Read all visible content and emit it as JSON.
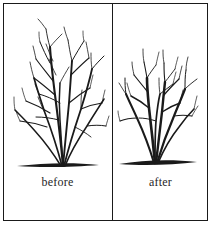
{
  "figure": {
    "background_color": "#ffffff",
    "ink_color": "#1a1a1a",
    "border_color": "#1a1a1a"
  },
  "panels": [
    {
      "id": "before",
      "caption": "before",
      "subject": "untrimmed-shrub",
      "description": "Tall dense deciduous shrub with many long unpruned branches",
      "branch_count": 14,
      "relative_height": "tall"
    },
    {
      "id": "after",
      "caption": "after",
      "subject": "pruned-shrub",
      "description": "Same shrub after pruning, shorter with fewer branches",
      "branch_count": 9,
      "relative_height": "short"
    }
  ],
  "labels": {
    "before": "before",
    "after": "after"
  },
  "icons": {
    "shrub_before": "shrub-untrimmed-icon",
    "shrub_after": "shrub-pruned-icon",
    "ground_line": "ground-line-icon"
  }
}
